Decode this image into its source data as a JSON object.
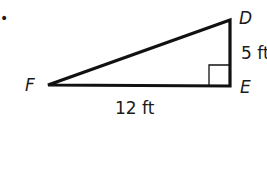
{
  "figure": {
    "marker": "•",
    "vertices": {
      "D": "D",
      "E": "E",
      "F": "F"
    },
    "sides": {
      "DE": "5 ft",
      "FE": "12 ft"
    },
    "right_angle_at": "E",
    "colors": {
      "stroke": "#111111",
      "text": "#1a1a1a",
      "background": "#ffffff"
    }
  }
}
